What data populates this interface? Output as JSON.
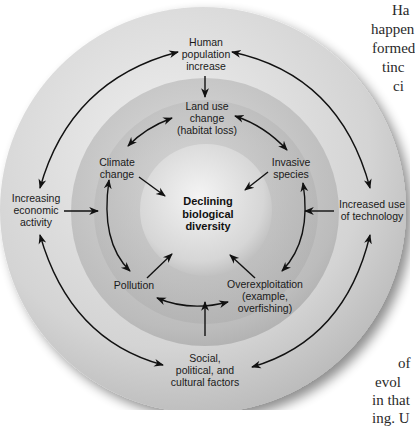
{
  "diagram": {
    "title": "Declining biological diversity",
    "center": {
      "lines": [
        "Declining",
        "biological",
        "diversity"
      ]
    },
    "outer_ring": [
      {
        "id": "human-population",
        "lines": [
          "Human",
          "population",
          "increase"
        ]
      },
      {
        "id": "economic-activity",
        "lines": [
          "Increasing",
          "economic",
          "activity"
        ]
      },
      {
        "id": "technology",
        "lines": [
          "Increased use",
          "of technology"
        ]
      },
      {
        "id": "social-factors",
        "lines": [
          "Social,",
          "political, and",
          "cultural factors"
        ]
      }
    ],
    "inner_ring": [
      {
        "id": "land-use",
        "lines": [
          "Land use",
          "change",
          "(habitat loss)"
        ]
      },
      {
        "id": "climate-change",
        "lines": [
          "Climate",
          "change"
        ]
      },
      {
        "id": "invasive-species",
        "lines": [
          "Invasive",
          "species"
        ]
      },
      {
        "id": "pollution",
        "lines": [
          "Pollution"
        ]
      },
      {
        "id": "overexploitation",
        "lines": [
          "Overexploitation",
          "(example,",
          "overfishing)"
        ]
      }
    ],
    "colors": {
      "outer_ring": "#d6d6d6",
      "middle_ring": "#bdbdbd",
      "inner_ring": "#b0b0b0",
      "center_sphere": "#e2e2e2",
      "arrow": "#111111",
      "text": "#1a1a1a"
    }
  },
  "side_text": {
    "top": [
      "Ha",
      "happen",
      "formed",
      "tinc",
      "ci"
    ],
    "bottom": [
      "of",
      "evol",
      "in that",
      "ing. U"
    ]
  }
}
